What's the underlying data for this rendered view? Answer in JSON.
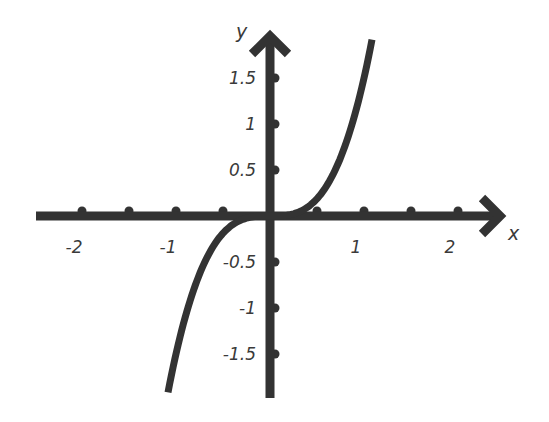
{
  "chart_data": {
    "type": "line",
    "title": "",
    "xlabel": "x",
    "ylabel": "y",
    "function": "y = 1.5 x^3",
    "xlim": [
      -2.5,
      2.5
    ],
    "ylim": [
      -2,
      2
    ],
    "grid": false,
    "legend": null,
    "x_ticks": [
      -2,
      -1.5,
      -1,
      -0.5,
      0.5,
      1,
      1.5,
      2
    ],
    "x_tick_labels": [
      {
        "value": -2,
        "label": "-2"
      },
      {
        "value": -1,
        "label": "-1"
      },
      {
        "value": 1,
        "label": "1"
      },
      {
        "value": 2,
        "label": "2"
      }
    ],
    "y_ticks": [
      1.5,
      1,
      0.5,
      -0.5,
      -1,
      -1.5
    ],
    "y_tick_labels": [
      {
        "value": 1.5,
        "label": "1.5"
      },
      {
        "value": 1,
        "label": "1"
      },
      {
        "value": 0.5,
        "label": "0.5"
      },
      {
        "value": -0.5,
        "label": "-0.5"
      },
      {
        "value": -1,
        "label": "-1"
      },
      {
        "value": -1.5,
        "label": "-1.5"
      }
    ],
    "series": [
      {
        "name": "cubic",
        "x_range": [
          -1.085,
          1.085
        ],
        "coef": 1.5,
        "power": 3
      }
    ],
    "colors": {
      "axis": "#333333",
      "curve": "#333333",
      "text": "#3a3a3a"
    }
  },
  "layout": {
    "origin_px": [
      270,
      216
    ],
    "x_unit_px": 94,
    "y_unit_px": 92,
    "x_axis_extent_px": [
      36,
      500
    ],
    "y_axis_extent_px": [
      36,
      398
    ]
  }
}
